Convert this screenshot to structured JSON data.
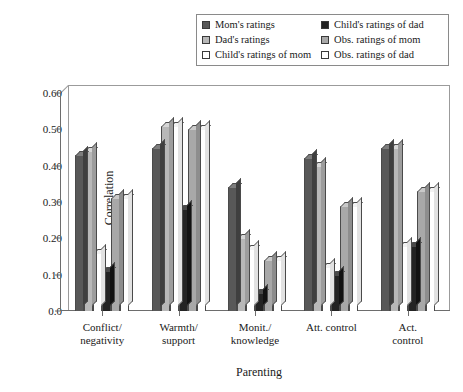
{
  "legend": {
    "columns": [
      [
        {
          "label": "Mom's ratings",
          "color": "#585858",
          "name": "moms-ratings"
        },
        {
          "label": "Dad's ratings",
          "color": "#b8b8b8",
          "name": "dads-ratings"
        },
        {
          "label": "Child's ratings of mom",
          "color": "#ffffff",
          "name": "childs-ratings-of-mom"
        }
      ],
      [
        {
          "label": "Child's ratings of dad",
          "color": "#232323",
          "name": "childs-ratings-of-dad"
        },
        {
          "label": "Obs. ratings of mom",
          "color": "#a8a8a8",
          "name": "obs-ratings-of-mom"
        },
        {
          "label": "Obs. ratings of dad",
          "color": "#ffffff",
          "name": "obs-ratings-of-dad"
        }
      ]
    ]
  },
  "chart_data": {
    "type": "bar",
    "title": "",
    "xlabel": "Parenting",
    "ylabel": "Correlation",
    "ylim": [
      0.0,
      0.6
    ],
    "yticks": [
      "0.0",
      "0.10",
      "0.20",
      "0.30",
      "0.40",
      "0.50",
      "0.60"
    ],
    "ytick_values": [
      0.0,
      0.1,
      0.2,
      0.3,
      0.4,
      0.5,
      0.6
    ],
    "grid": false,
    "legend_position": "top",
    "style": "3d-grouped-bar",
    "categories": [
      "Conflict/\nnegativity",
      "Warmth/\nsupport",
      "Monit./\nknowledge",
      "Att. control",
      "Act. control"
    ],
    "series": [
      {
        "name": "Mom's ratings",
        "color": "#585858",
        "values": [
          0.43,
          0.45,
          0.34,
          0.42,
          0.45
        ]
      },
      {
        "name": "Dad's ratings",
        "color": "#b8b8b8",
        "values": [
          0.44,
          0.51,
          0.2,
          0.4,
          0.45
        ]
      },
      {
        "name": "Child's ratings of mom",
        "color": "#ffffff",
        "values": [
          0.16,
          0.51,
          0.17,
          0.12,
          0.18
        ]
      },
      {
        "name": "Child's ratings of dad",
        "color": "#232323",
        "values": [
          0.11,
          0.28,
          0.05,
          0.1,
          0.18
        ]
      },
      {
        "name": "Obs. ratings of mom",
        "color": "#a8a8a8",
        "values": [
          0.31,
          0.5,
          0.14,
          0.29,
          0.33
        ]
      },
      {
        "name": "Obs. ratings of dad",
        "color": "#ffffff",
        "values": [
          0.31,
          0.5,
          0.14,
          0.29,
          0.33
        ]
      }
    ]
  }
}
